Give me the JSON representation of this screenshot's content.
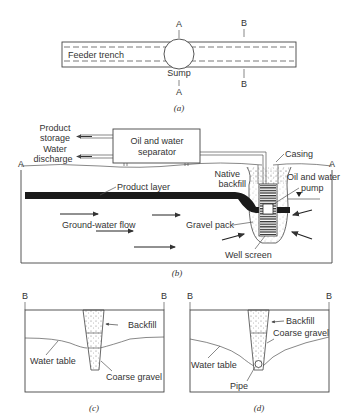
{
  "panel_a": {
    "trench_label": "Feeder trench",
    "sump_label": "Sump",
    "section_a_top": "A",
    "section_a_bottom": "A",
    "section_b_top": "B",
    "section_b_bottom": "B",
    "caption": "(a)"
  },
  "panel_b": {
    "product_storage_1": "Product",
    "product_storage_2": "storage",
    "water_discharge_1": "Water",
    "water_discharge_2": "discharge",
    "separator_1": "Oil and water",
    "separator_2": "separator",
    "casing": "Casing",
    "native_backfill_1": "Native",
    "native_backfill_2": "backfill",
    "pump_1": "Oil and water",
    "pump_2": "pump",
    "product_layer": "Product layer",
    "groundwater_flow": "Ground-water flow",
    "gravel_pack": "Gravel pack",
    "well_screen": "Well screen",
    "section_left": "A",
    "section_right": "A",
    "caption": "(b)"
  },
  "panel_c": {
    "section_left": "B",
    "section_right": "B",
    "backfill": "Backfill",
    "water_table": "Water table",
    "coarse_gravel": "Coarse gravel",
    "caption": "(c)"
  },
  "panel_d": {
    "section_left": "B",
    "section_right": "B",
    "backfill": "Backfill",
    "coarse_gravel": "Coarse gravel",
    "water_table": "Water table",
    "pipe": "Pipe",
    "caption": "(d)"
  }
}
